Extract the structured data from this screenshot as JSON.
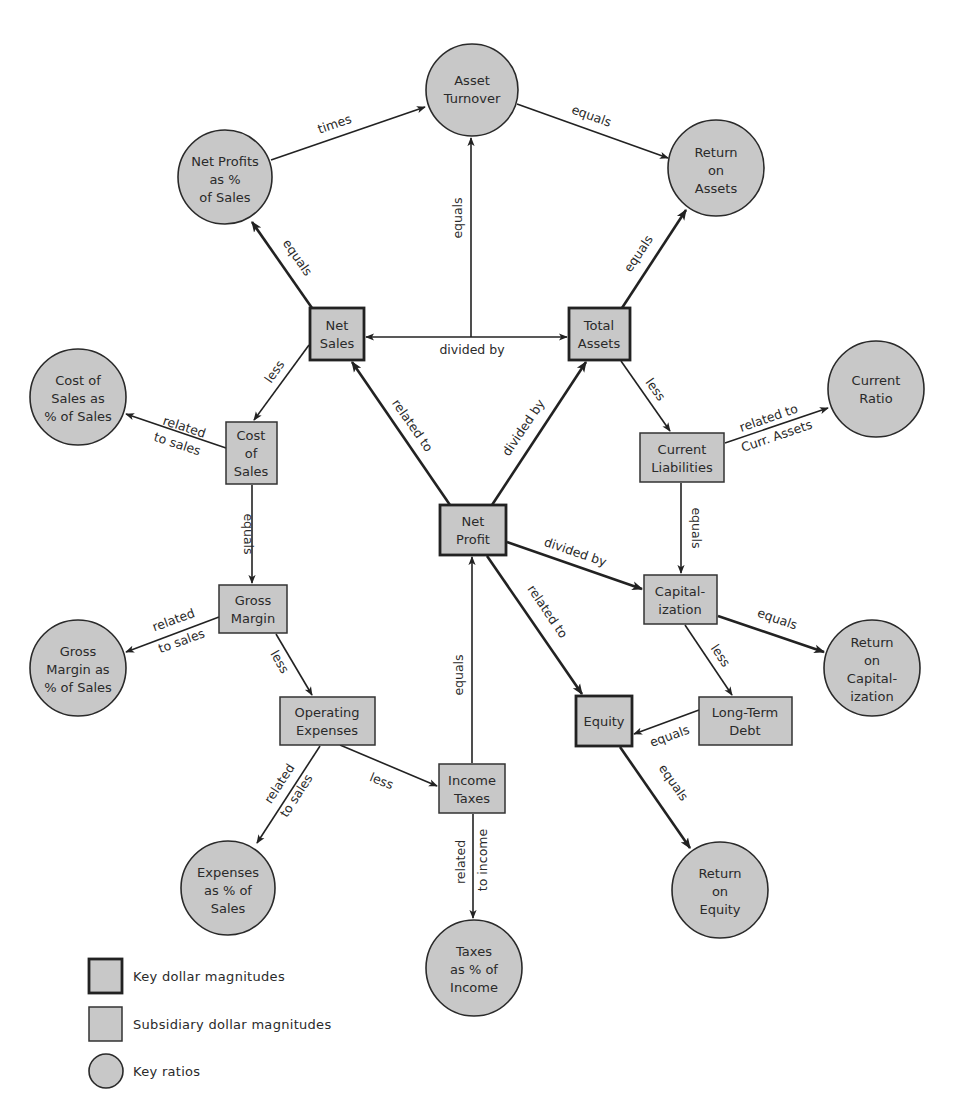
{
  "diagram": {
    "ratios": {
      "asset_turnover": [
        "Asset",
        "Turnover"
      ],
      "return_on_assets": [
        "Return",
        "on",
        "Assets"
      ],
      "net_profits_pct_sales": [
        "Net Profits",
        "as %",
        "of Sales"
      ],
      "current_ratio": [
        "Current",
        "Ratio"
      ],
      "cost_of_sales_pct": [
        "Cost of",
        "Sales as",
        "% of Sales"
      ],
      "gross_margin_pct": [
        "Gross",
        "Margin as",
        "% of Sales"
      ],
      "return_on_capitalization": [
        "Return",
        "on",
        "Capital-",
        "ization"
      ],
      "expenses_pct_sales": [
        "Expenses",
        "as % of",
        "Sales"
      ],
      "return_on_equity": [
        "Return",
        "on",
        "Equity"
      ],
      "taxes_pct_income": [
        "Taxes",
        "as % of",
        "Income"
      ]
    },
    "key_magnitudes": {
      "net_sales": [
        "Net",
        "Sales"
      ],
      "total_assets": [
        "Total",
        "Assets"
      ],
      "net_profit": [
        "Net",
        "Profit"
      ],
      "equity": [
        "Equity"
      ]
    },
    "subsidiary_magnitudes": {
      "cost_of_sales": [
        "Cost",
        "of",
        "Sales"
      ],
      "current_liabilities": [
        "Current",
        "Liabilities"
      ],
      "gross_margin": [
        "Gross",
        "Margin"
      ],
      "capitalization": [
        "Capital-",
        "ization"
      ],
      "operating_expenses": [
        "Operating",
        "Expenses"
      ],
      "long_term_debt": [
        "Long-Term",
        "Debt"
      ],
      "income_taxes": [
        "Income",
        "Taxes"
      ]
    },
    "edge_labels": {
      "times": "times",
      "asset_turnover_to_roa": "equals",
      "net_sales_to_npps": "equals",
      "division_to_asset_turnover": "equals",
      "total_assets_to_roa": "equals",
      "net_sales_total_assets": "divided by",
      "net_sales_to_cost_of_sales": "less",
      "cost_of_sales_to_ratio": [
        "related",
        "to sales"
      ],
      "net_profit_to_net_sales": "related to",
      "net_profit_to_total_assets": "divided by",
      "total_assets_to_current_liabilities": "less",
      "current_liabilities_to_current_ratio": [
        "related to",
        "Curr. Assets"
      ],
      "current_liabilities_to_capitalization": "equals",
      "cost_of_sales_to_gross_margin": "equals",
      "gross_margin_to_ratio": [
        "related",
        "to sales"
      ],
      "gross_margin_to_operating_expenses": "less",
      "net_profit_to_capitalization": "divided by",
      "capitalization_to_roc": "equals",
      "net_profit_to_equity": "related to",
      "capitalization_to_long_term_debt": "less",
      "long_term_debt_to_equity": "equals",
      "income_taxes_to_net_profit": "equals",
      "operating_expenses_to_income_taxes": "less",
      "operating_expenses_to_ratio": [
        "related",
        "to sales"
      ],
      "income_taxes_to_ratio": [
        "related",
        "to income"
      ],
      "equity_to_roe": "equals"
    }
  },
  "legend": {
    "key_dollar": "Key dollar magnitudes",
    "subsidiary_dollar": "Subsidiary dollar magnitudes",
    "key_ratios": "Key ratios"
  },
  "colors": {
    "node_fill": "#c8c8c8",
    "stroke": "#222222",
    "background": "#ffffff"
  }
}
